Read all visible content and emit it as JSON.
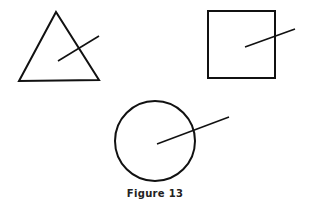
{
  "figure": {
    "caption": "Figure 13",
    "stroke_color": "#111111",
    "shapes": [
      {
        "type": "triangle",
        "label": "triangle-with-line"
      },
      {
        "type": "square",
        "label": "square-with-line"
      },
      {
        "type": "circle",
        "label": "circle-with-line"
      }
    ]
  }
}
